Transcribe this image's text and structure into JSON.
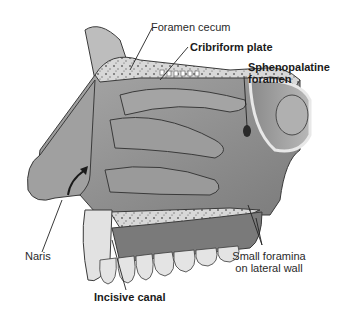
{
  "figure": {
    "colors": {
      "background": "#ffffff",
      "bone_light": "#dcdcdc",
      "bone_dark": "#8a8a8a",
      "tissue": "#9a9a9a",
      "tissue_dark": "#6e6e6e",
      "outline": "#3a3a3a",
      "leader": "#222222"
    }
  },
  "labels": {
    "foramen_cecum": "Foramen cecum",
    "cribriform_plate": "Cribriform plate",
    "sphenopalatine_1": "Sphenopalatine",
    "sphenopalatine_2": "foramen",
    "naris": "Naris",
    "small_foramina_1": "Small foramina",
    "small_foramina_2": "on lateral wall",
    "incisive_canal": "Incisive canal"
  }
}
